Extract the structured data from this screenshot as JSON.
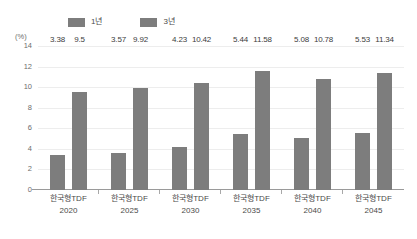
{
  "chart_data": {
    "type": "bar",
    "title": "",
    "subtitle": "",
    "xlabel": "",
    "ylabel": "(%)",
    "unit_label": "(%)",
    "ylim": [
      0,
      14
    ],
    "yticks": [
      14,
      12,
      10,
      8,
      6,
      4,
      2,
      0
    ],
    "grid": true,
    "legend_position": "top-left",
    "categories": [
      "한국형TDF 2020",
      "한국형TDF 2025",
      "한국형TDF 2030",
      "한국형TDF 2035",
      "한국형TDF 2040",
      "한국형TDF 2045"
    ],
    "category_names": [
      "한국형TDF",
      "한국형TDF",
      "한국형TDF",
      "한국형TDF",
      "한국형TDF",
      "한국형TDF"
    ],
    "category_years": [
      "2020",
      "2025",
      "2030",
      "2035",
      "2040",
      "2045"
    ],
    "series": [
      {
        "name": "1년",
        "color": "#7d7d7d",
        "values": [
          3.38,
          3.57,
          4.23,
          5.44,
          5.08,
          5.53
        ],
        "labels": [
          "3.38",
          "3.57",
          "4.23",
          "5.44",
          "5.08",
          "5.53"
        ]
      },
      {
        "name": "3년",
        "color": "#7d7d7d",
        "values": [
          9.5,
          9.92,
          10.42,
          11.58,
          10.78,
          11.34
        ],
        "labels": [
          "9.5",
          "9.92",
          "10.42",
          "11.58",
          "10.78",
          "11.34"
        ]
      }
    ]
  },
  "legend": {
    "items": [
      {
        "label": "1년",
        "color": "#7d7d7d"
      },
      {
        "label": "3년",
        "color": "#7d7d7d"
      }
    ]
  },
  "axis": {
    "unit": "(%)",
    "yticks": [
      "14",
      "12",
      "10",
      "8",
      "6",
      "4",
      "2",
      "0"
    ]
  }
}
